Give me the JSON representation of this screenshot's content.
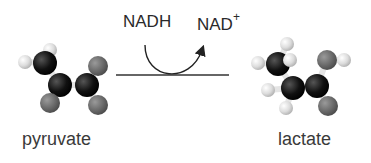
{
  "reaction": {
    "cofactor_in": "NADH",
    "cofactor_out_base": "NAD",
    "cofactor_out_charge": "+",
    "reactant": "pyruvate",
    "product": "lactate"
  },
  "atom_colors": {
    "carbon": "#111111",
    "oxygen": "#6e6e6e",
    "hydrogen": "#d8d8d8"
  },
  "molecules": {
    "pyruvate": {
      "atoms": [
        {
          "el": "H",
          "x": 50,
          "y": 50,
          "r": 7
        },
        {
          "el": "H",
          "x": 25,
          "y": 62,
          "r": 7
        },
        {
          "el": "C",
          "x": 45,
          "y": 63,
          "r": 12
        },
        {
          "el": "C",
          "x": 60,
          "y": 85,
          "r": 12
        },
        {
          "el": "C",
          "x": 87,
          "y": 85,
          "r": 12
        },
        {
          "el": "O",
          "x": 98,
          "y": 66,
          "r": 10
        },
        {
          "el": "O",
          "x": 50,
          "y": 103,
          "r": 10
        },
        {
          "el": "O",
          "x": 98,
          "y": 105,
          "r": 10
        }
      ]
    },
    "lactate": {
      "atoms": [
        {
          "el": "H",
          "x": 287,
          "y": 44,
          "r": 7
        },
        {
          "el": "H",
          "x": 258,
          "y": 63,
          "r": 7
        },
        {
          "el": "C",
          "x": 278,
          "y": 64,
          "r": 12
        },
        {
          "el": "H",
          "x": 290,
          "y": 60,
          "r": 7
        },
        {
          "el": "H",
          "x": 268,
          "y": 90,
          "r": 7
        },
        {
          "el": "C",
          "x": 293,
          "y": 88,
          "r": 12
        },
        {
          "el": "C",
          "x": 317,
          "y": 86,
          "r": 12
        },
        {
          "el": "H",
          "x": 286,
          "y": 108,
          "r": 7
        },
        {
          "el": "O",
          "x": 327,
          "y": 60,
          "r": 10
        },
        {
          "el": "H",
          "x": 344,
          "y": 60,
          "r": 7
        },
        {
          "el": "O",
          "x": 328,
          "y": 106,
          "r": 10
        }
      ]
    }
  }
}
